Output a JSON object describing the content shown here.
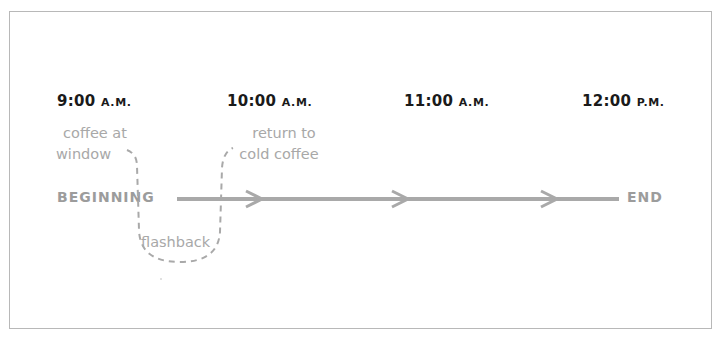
{
  "timeline": {
    "times": [
      {
        "value": "9:00",
        "suffix": "A.M."
      },
      {
        "value": "10:00",
        "suffix": "A.M."
      },
      {
        "value": "11:00",
        "suffix": "A.M."
      },
      {
        "value": "12:00",
        "suffix": "P.M."
      }
    ],
    "start_label": "BEGINNING",
    "end_label": "END",
    "notes": {
      "left_line1": "coffee at",
      "left_line2": "window",
      "right_line1": "return to",
      "right_line2": "cold coffee",
      "loop": "flashback"
    },
    "colors": {
      "line": "#a9a9a9",
      "dashed": "#a9a9a9",
      "time_text": "#1a1a1a",
      "label_text": "#9c9c9c"
    }
  }
}
